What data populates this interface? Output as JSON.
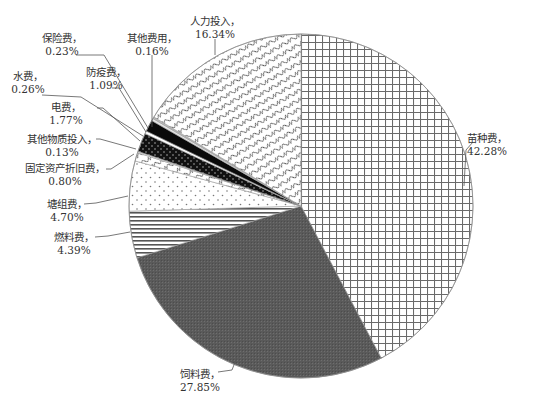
{
  "chart_data": {
    "type": "pie",
    "title": "",
    "start_angle": "12 o'clock",
    "direction": "clockwise",
    "legend": "none (direct labels with leader lines)",
    "slices": [
      {
        "label": "苗种费",
        "value": 42.28,
        "display": "42.28%",
        "pattern": "grid"
      },
      {
        "label": "饲料费",
        "value": 27.85,
        "display": "27.85%",
        "pattern": "dark-fill"
      },
      {
        "label": "燃料费",
        "value": 4.39,
        "display": "4.39%",
        "pattern": "horizontal-lines"
      },
      {
        "label": "塘组费",
        "value": 4.7,
        "display": "4.70%",
        "pattern": "sparse-dots"
      },
      {
        "label": "固定资产折旧费",
        "value": 0.8,
        "display": "0.80%",
        "pattern": "wave"
      },
      {
        "label": "其他物质投入",
        "value": 0.13,
        "display": "0.13%",
        "pattern": "light"
      },
      {
        "label": "电费",
        "value": 1.77,
        "display": "1.77%",
        "pattern": "black-dots"
      },
      {
        "label": "水费",
        "value": 0.26,
        "display": "0.26%",
        "pattern": "white"
      },
      {
        "label": "防疫费",
        "value": 1.09,
        "display": "1.09%",
        "pattern": "solid-black"
      },
      {
        "label": "保险费",
        "value": 0.23,
        "display": "0.23%",
        "pattern": "light"
      },
      {
        "label": "其他费用",
        "value": 0.16,
        "display": "0.16%",
        "pattern": "gray"
      },
      {
        "label": "人力投入",
        "value": 16.34,
        "display": "16.34%",
        "pattern": "wave"
      }
    ]
  },
  "layout": {
    "center": [
      301,
      206
    ],
    "radius": 172,
    "labels": [
      {
        "x": 467,
        "y": 142,
        "anchor": "start",
        "line": [
          [
            473,
            142
          ],
          [
            466,
            150
          ],
          [
            464,
            186
          ]
        ]
      },
      {
        "x": 200,
        "y": 378,
        "anchor": "middle",
        "line": [
          [
            218,
            372
          ],
          [
            232,
            370
          ],
          [
            237,
            357
          ]
        ]
      },
      {
        "x": 74,
        "y": 241,
        "anchor": "middle",
        "line": [
          [
            95,
            237
          ],
          [
            108,
            236
          ],
          [
            130,
            232
          ]
        ]
      },
      {
        "x": 67,
        "y": 208,
        "anchor": "middle",
        "line": [
          [
            84,
            204
          ],
          [
            96,
            203
          ],
          [
            128,
            196
          ]
        ]
      },
      {
        "x": 65,
        "y": 172,
        "anchor": "middle",
        "line": [
          [
            106,
            169
          ],
          [
            111,
            169
          ],
          [
            134,
            154
          ]
        ]
      },
      {
        "x": 62,
        "y": 143,
        "anchor": "middle",
        "line": [
          [
            96,
            139
          ],
          [
            100,
            139
          ],
          [
            136,
            149
          ]
        ]
      },
      {
        "x": 66,
        "y": 111,
        "anchor": "middle",
        "line": [
          [
            97,
            108
          ],
          [
            103,
            108
          ],
          [
            140,
            141
          ]
        ]
      },
      {
        "x": 28,
        "y": 80,
        "anchor": "middle",
        "line": [
          [
            42,
            95
          ],
          [
            81,
            97
          ],
          [
            143,
            136
          ]
        ]
      },
      {
        "x": 106,
        "y": 76,
        "anchor": "middle",
        "line": [
          [
            112,
            88
          ],
          [
            119,
            88
          ],
          [
            146,
            132
          ]
        ]
      },
      {
        "x": 62,
        "y": 42,
        "anchor": "middle",
        "line": [
          [
            76,
            55
          ],
          [
            104,
            55
          ],
          [
            148,
            128
          ]
        ]
      },
      {
        "x": 152,
        "y": 42,
        "anchor": "middle",
        "line": [
          [
            152,
            55
          ],
          [
            152,
            127
          ]
        ]
      },
      {
        "x": 215,
        "y": 25,
        "anchor": "middle",
        "line": [
          [
            215,
            39
          ],
          [
            215,
            55
          ]
        ]
      }
    ]
  }
}
